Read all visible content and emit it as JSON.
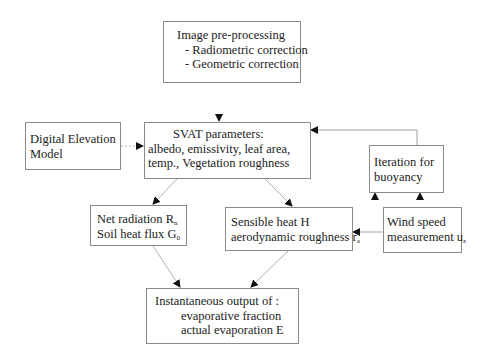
{
  "diagram": {
    "type": "flowchart",
    "nodes": {
      "preprocessing": {
        "title": "Image pre-processing",
        "items": [
          "- Radiometric correction",
          "- Geometric correction"
        ]
      },
      "dem": {
        "lines": [
          "Digital Elevation",
          "Model"
        ]
      },
      "svat": {
        "title": "SVAT parameters:",
        "lines": [
          "albedo, emissivity, leaf area,",
          "temp., Vegetation roughness"
        ]
      },
      "iteration": {
        "lines": [
          "Iteration for",
          "buoyancy"
        ]
      },
      "net_radiation": {
        "line1": "Net radiation R",
        "line1_sub": "n",
        "line2": "Soil heat flux G",
        "line2_sub": "0"
      },
      "sensible_heat": {
        "line1": "Sensible heat H",
        "line2": "aerodynamic roughness r",
        "line2_sub": "a"
      },
      "wind_speed": {
        "line1": "Wind speed",
        "line2": "measurement u",
        "line2_sub": "z"
      },
      "output": {
        "title": "Instantaneous output of :",
        "items": [
          "evaporative fraction",
          "actual evaporation E"
        ]
      }
    },
    "edges": [
      {
        "from": "preprocessing",
        "to": "svat"
      },
      {
        "from": "dem",
        "to": "svat"
      },
      {
        "from": "iteration",
        "to": "svat"
      },
      {
        "from": "svat",
        "to": "net_radiation"
      },
      {
        "from": "svat",
        "to": "sensible_heat"
      },
      {
        "from": "wind_speed",
        "to": "sensible_heat"
      },
      {
        "from": "wind_speed",
        "to": "iteration"
      },
      {
        "from": "sensible_heat",
        "to": "iteration"
      },
      {
        "from": "net_radiation",
        "to": "output"
      },
      {
        "from": "sensible_heat",
        "to": "output"
      }
    ],
    "colors": {
      "border": "#8a8a8a",
      "line": "#a0a0a0",
      "arrowhead": "#111111",
      "text": "#222222"
    }
  }
}
